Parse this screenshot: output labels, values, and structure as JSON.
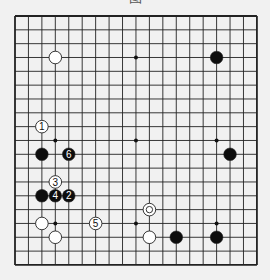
{
  "caption": "图",
  "board": {
    "size": 19,
    "origin_x": 15,
    "origin_y": 16,
    "step_x": 13.44,
    "step_y": 13.83,
    "line_color": "#222222",
    "background": "#f1f1f1",
    "star_points": [
      [
        3,
        3
      ],
      [
        9,
        3
      ],
      [
        15,
        3
      ],
      [
        3,
        9
      ],
      [
        9,
        9
      ],
      [
        15,
        9
      ],
      [
        3,
        15
      ],
      [
        9,
        15
      ],
      [
        15,
        15
      ]
    ]
  },
  "stones": [
    {
      "color": "white",
      "col": 3,
      "row": 3,
      "label": ""
    },
    {
      "color": "black",
      "col": 15,
      "row": 3,
      "label": ""
    },
    {
      "color": "white",
      "col": 2,
      "row": 8,
      "label": "1"
    },
    {
      "color": "black",
      "col": 2,
      "row": 10,
      "label": ""
    },
    {
      "color": "black",
      "col": 4,
      "row": 10,
      "label": "6"
    },
    {
      "color": "black",
      "col": 16,
      "row": 10,
      "label": ""
    },
    {
      "color": "white",
      "col": 3,
      "row": 12,
      "label": "3"
    },
    {
      "color": "black",
      "col": 2,
      "row": 13,
      "label": ""
    },
    {
      "color": "black",
      "col": 3,
      "row": 13,
      "label": "4"
    },
    {
      "color": "black",
      "col": 4,
      "row": 13,
      "label": "2"
    },
    {
      "color": "white",
      "col": 10,
      "row": 14,
      "label": "",
      "marker": "circle"
    },
    {
      "color": "white",
      "col": 2,
      "row": 15,
      "label": ""
    },
    {
      "color": "white",
      "col": 6,
      "row": 15,
      "label": "5"
    },
    {
      "color": "white",
      "col": 3,
      "row": 16,
      "label": ""
    },
    {
      "color": "white",
      "col": 10,
      "row": 16,
      "label": ""
    },
    {
      "color": "black",
      "col": 12,
      "row": 16,
      "label": ""
    },
    {
      "color": "black",
      "col": 15,
      "row": 16,
      "label": ""
    }
  ]
}
